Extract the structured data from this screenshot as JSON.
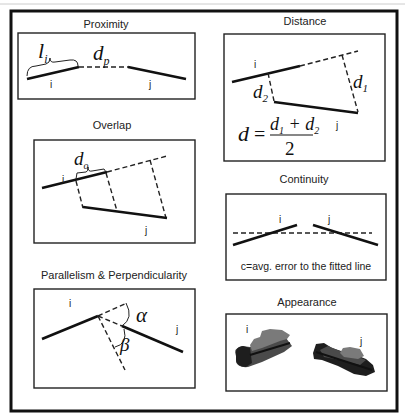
{
  "figure": {
    "header_partial": "...plural grouping...",
    "panels": [
      {
        "id": "proximity",
        "title": "Proximity",
        "segment_labels": [
          "i",
          "j"
        ],
        "math_labels": {
          "length": "l",
          "length_sub": "i",
          "gap": "d",
          "gap_sub": "p"
        }
      },
      {
        "id": "distance",
        "title": "Distance",
        "segment_labels": [
          "i",
          "j"
        ],
        "math_labels": {
          "d1": "d",
          "d1_sub": "1",
          "d2": "d",
          "d2_sub": "2"
        },
        "formula": {
          "lhs": "d =",
          "numerator": "d₁ + d₂",
          "denominator": "2"
        }
      },
      {
        "id": "overlap",
        "title": "Overlap",
        "segment_labels": [
          "i",
          "j"
        ],
        "math_labels": {
          "overlap": "d",
          "overlap_sub": "o"
        }
      },
      {
        "id": "continuity",
        "title": "Continuity",
        "segment_labels": [
          "i",
          "j"
        ],
        "caption": "c=avg. error to the fitted line"
      },
      {
        "id": "parallelism",
        "title": "Parallelism & Perpendicularity",
        "segment_labels": [
          "i",
          "j"
        ],
        "math_labels": {
          "alpha": "α",
          "beta": "β"
        }
      },
      {
        "id": "appearance",
        "title": "Appearance",
        "segment_labels": [
          "i",
          "j"
        ]
      }
    ]
  },
  "colors": {
    "line": "#111111",
    "blob_dark": "#1e1e1e",
    "blob_mid": "#4a4a4a",
    "blob_light": "#7a7a7a"
  }
}
